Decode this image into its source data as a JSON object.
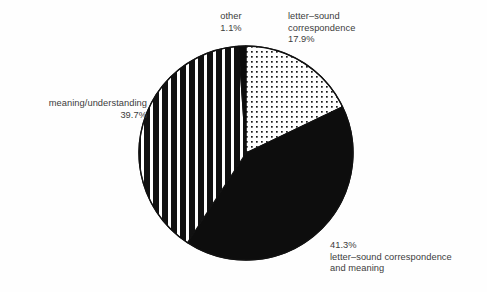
{
  "chart_data": {
    "type": "pie",
    "title": "",
    "subtitle": "",
    "xlabel": "",
    "ylabel": "",
    "legend_position": "none",
    "grid": false,
    "units": "percent",
    "total": 100.0,
    "start_angle_deg": 0,
    "direction": "clockwise",
    "categories": [
      "letter–sound correspondence",
      "letter–sound correspondence and meaning",
      "meaning/understanding",
      "other"
    ],
    "values": [
      17.9,
      41.3,
      39.7,
      1.1
    ],
    "slices": [
      {
        "name": "letter-sound-correspondence",
        "label_lines": [
          "letter–sound",
          "correspondence",
          "17.9%"
        ],
        "value": 17.9,
        "value_text": "17.9%",
        "fill": "dots",
        "fill_color": "#ffffff",
        "pattern_color": "#1a1a1a",
        "start_deg": 0,
        "end_deg": 64.44
      },
      {
        "name": "letter-sound-correspondence-and-meaning",
        "label_lines": [
          "41.3%",
          "letter–sound correspondence",
          "and meaning"
        ],
        "value": 41.3,
        "value_text": "41.3%",
        "fill": "solid",
        "fill_color": "#0d0d0d",
        "pattern_color": "#0d0d0d",
        "start_deg": 64.44,
        "end_deg": 213.12
      },
      {
        "name": "meaning-understanding",
        "label_lines": [
          "meaning/understanding",
          "39.7%"
        ],
        "value": 39.7,
        "value_text": "39.7%",
        "fill": "vertical-stripes",
        "fill_color": "#ffffff",
        "pattern_color": "#111111",
        "start_deg": 213.12,
        "end_deg": 356.04
      },
      {
        "name": "other",
        "label_lines": [
          "other",
          "1.1%"
        ],
        "value": 1.1,
        "value_text": "1.1%",
        "fill": "solid",
        "fill_color": "#0d0d0d",
        "pattern_color": "#0d0d0d",
        "start_deg": 356.04,
        "end_deg": 360
      }
    ],
    "geometry": {
      "center_x": 246,
      "center_y": 153,
      "radius": 107,
      "outline_color": "#111111"
    }
  },
  "labels": {
    "other": {
      "line1": "other",
      "line2": "1.1%"
    },
    "letter_sound": {
      "line1": "letter–sound",
      "line2": "correspondence",
      "line3": "17.9%"
    },
    "meaning": {
      "line1": "meaning/understanding",
      "line2": "39.7%"
    },
    "both": {
      "line1": "41.3%",
      "line2": "letter–sound correspondence",
      "line3": "and meaning"
    }
  },
  "colors": {
    "background": "#fefefe",
    "text": "#3c3c3c",
    "ink": "#111111"
  }
}
